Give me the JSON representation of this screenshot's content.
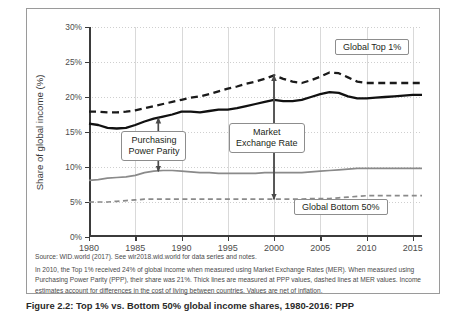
{
  "figure": {
    "ylabel": "Share of global income (%)",
    "caption": "Figure 2.2: Top 1% vs. Bottom 50% global income shares, 1980-2016: PPP"
  },
  "callouts": [
    {
      "name": "purchasing-power-parity",
      "text": "Purchasing\nPower Parity"
    },
    {
      "name": "market-exchange-rate",
      "text": "Market\nExchange Rate"
    }
  ],
  "legend": [
    {
      "name": "global-top-1",
      "label": "Global Top 1%"
    },
    {
      "name": "global-bottom-50",
      "label": "Global Bottom 50%"
    }
  ],
  "notes": {
    "line1": "Source: WID.world (2017). See wir2018.wid.world for data series and notes.",
    "line2": "In 2010, the Top 1% received 24% of global income when measured using Market Exchange Rates (MER). When measured using",
    "line3": "Purchasing Power Parity (PPP), their share was 21%. Thick lines are measured at PPP values, dashed lines at MER values. Income",
    "line4": "estimates account for differences in the cost of living between countries. Values are net of inflation."
  },
  "chart_data": {
    "type": "line",
    "title": "",
    "xlabel": "",
    "ylabel": "Share of global income (%)",
    "xlim": [
      1980,
      2016
    ],
    "ylim": [
      0,
      30
    ],
    "ytick_labels": [
      "0%",
      "5%",
      "10%",
      "15%",
      "20%",
      "25%",
      "30%"
    ],
    "ytick_values": [
      0,
      5,
      10,
      15,
      20,
      25,
      30
    ],
    "xtick_labels": [
      "1980",
      "1985",
      "1990",
      "1995",
      "2000",
      "2005",
      "2010",
      "2015"
    ],
    "xtick_values": [
      1980,
      1985,
      1990,
      1995,
      2000,
      2005,
      2010,
      2015
    ],
    "grid": "both",
    "legend_position": "inline-labels",
    "x": [
      1980,
      1981,
      1982,
      1983,
      1984,
      1985,
      1986,
      1987,
      1988,
      1989,
      1990,
      1991,
      1992,
      1993,
      1994,
      1995,
      1996,
      1997,
      1998,
      1999,
      2000,
      2001,
      2002,
      2003,
      2004,
      2005,
      2006,
      2007,
      2008,
      2009,
      2010,
      2011,
      2012,
      2013,
      2014,
      2015,
      2016
    ],
    "series": [
      {
        "name": "Global Top 1% (MER)",
        "style": "dashed",
        "color": "#1a1a1a",
        "values": [
          17.9,
          17.9,
          17.8,
          17.8,
          17.9,
          18.1,
          18.4,
          18.7,
          19.0,
          19.3,
          19.6,
          19.9,
          20.1,
          20.4,
          20.8,
          21.2,
          21.5,
          21.9,
          22.2,
          22.6,
          23.1,
          22.6,
          22.2,
          22.0,
          22.4,
          22.9,
          23.5,
          23.4,
          22.8,
          22.2,
          22.0,
          22.0,
          22.0,
          22.0,
          22.0,
          22.0,
          22.0
        ]
      },
      {
        "name": "Global Top 1% (PPP)",
        "style": "solid",
        "color": "#111111",
        "values": [
          16.2,
          16.0,
          15.6,
          15.5,
          15.6,
          16.0,
          16.5,
          16.9,
          17.2,
          17.5,
          17.9,
          17.9,
          17.8,
          18.0,
          18.2,
          18.2,
          18.4,
          18.7,
          19.0,
          19.3,
          19.6,
          19.4,
          19.4,
          19.6,
          20.0,
          20.4,
          20.7,
          20.6,
          20.1,
          19.8,
          19.8,
          19.9,
          20.0,
          20.1,
          20.2,
          20.3,
          20.3
        ]
      },
      {
        "name": "Global Bottom 50% (PPP)",
        "style": "solid",
        "color": "#8a8a8a",
        "values": [
          8.1,
          8.2,
          8.4,
          8.5,
          8.6,
          8.8,
          9.2,
          9.4,
          9.5,
          9.5,
          9.4,
          9.3,
          9.2,
          9.2,
          9.1,
          9.1,
          9.1,
          9.1,
          9.1,
          9.2,
          9.2,
          9.2,
          9.2,
          9.2,
          9.3,
          9.4,
          9.5,
          9.6,
          9.7,
          9.8,
          9.8,
          9.8,
          9.8,
          9.8,
          9.8,
          9.8,
          9.8
        ]
      },
      {
        "name": "Global Bottom 50% (MER)",
        "style": "dashed",
        "color": "#8a8a8a",
        "values": [
          5.0,
          5.0,
          5.0,
          5.1,
          5.2,
          5.3,
          5.4,
          5.4,
          5.4,
          5.4,
          5.4,
          5.4,
          5.4,
          5.4,
          5.4,
          5.4,
          5.4,
          5.4,
          5.4,
          5.4,
          5.4,
          5.4,
          5.4,
          5.4,
          5.5,
          5.5,
          5.5,
          5.6,
          5.7,
          5.8,
          5.9,
          5.9,
          5.9,
          5.9,
          5.9,
          5.9,
          5.9
        ]
      }
    ],
    "annotations": [
      {
        "label": "Purchasing Power Parity",
        "x": 1987.5,
        "span_y": [
          9.4,
          17.0
        ]
      },
      {
        "label": "Market Exchange Rate",
        "x": 2000.0,
        "span_y": [
          5.4,
          23.1
        ]
      }
    ]
  }
}
